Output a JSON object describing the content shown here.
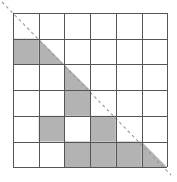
{
  "figure": {
    "type": "grid-diagram",
    "width": 177,
    "height": 182
  },
  "chart_data": {
    "type": "heatmap",
    "title": "",
    "xlabel": "",
    "ylabel": "",
    "grid": true,
    "rows": 6,
    "cols": 6,
    "legend": [],
    "annotations": [
      {
        "name": "dashed-diagonal",
        "style": "dashed",
        "from": [
          0,
          0
        ],
        "to": [
          6,
          6
        ],
        "color": "#999999"
      }
    ],
    "cell_states": [
      [
        "empty",
        "empty",
        "empty",
        "empty",
        "empty",
        "empty"
      ],
      [
        "full",
        "triangle-lower-left",
        "empty",
        "empty",
        "empty",
        "empty"
      ],
      [
        "empty",
        "empty",
        "triangle-lower-left",
        "empty",
        "empty",
        "empty"
      ],
      [
        "empty",
        "empty",
        "full",
        "empty",
        "empty",
        "empty"
      ],
      [
        "empty",
        "full",
        "empty",
        "full",
        "empty",
        "empty"
      ],
      [
        "empty",
        "empty",
        "full",
        "full",
        "full",
        "triangle-lower-left"
      ]
    ],
    "values": [
      [
        0,
        0,
        0,
        0,
        0,
        0
      ],
      [
        1,
        0.5,
        0,
        0,
        0,
        0
      ],
      [
        0,
        0,
        0.5,
        0,
        0,
        0
      ],
      [
        0,
        0,
        1,
        0,
        0,
        0
      ],
      [
        0,
        1,
        0,
        1,
        0,
        0
      ],
      [
        0,
        0,
        1,
        1,
        1,
        0.5
      ]
    ],
    "xticklabels": [
      "1",
      "2",
      "3",
      "4",
      "5",
      "6"
    ],
    "yticklabels": [
      "1",
      "2",
      "3",
      "4",
      "5",
      "6"
    ]
  },
  "geometry": {
    "grid_left": 13,
    "grid_top": 13,
    "cell_size": 25.7,
    "diagonal_start_x": 2,
    "diagonal_start_y": 2,
    "diagonal_end_x": 171,
    "diagonal_end_y": 175
  },
  "colors": {
    "fill": "#b3b3b3",
    "grid_line": "#555555",
    "background": "#ffffff",
    "diagonal": "#999999"
  }
}
